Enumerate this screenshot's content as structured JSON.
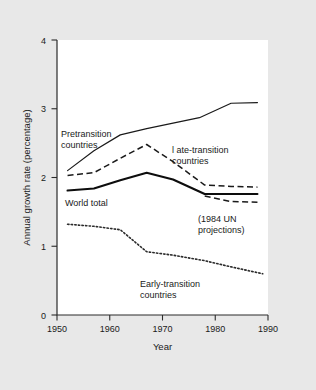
{
  "chart_data": {
    "type": "line",
    "title": "",
    "xlabel": "Year",
    "ylabel": "Annual growth rate (percentage)",
    "xlim": [
      1950,
      1990
    ],
    "ylim": [
      0,
      4
    ],
    "xticks": [
      1950,
      1960,
      1970,
      1980,
      1990
    ],
    "xtick_labels": [
      "1950",
      "1960",
      "1970",
      "1980",
      "1990"
    ],
    "yticks": [
      0,
      1,
      2,
      3,
      4
    ],
    "ytick_labels": [
      "0",
      "1",
      "2",
      "3",
      "4"
    ],
    "grid": false,
    "legend": "annotations-inline",
    "series": [
      {
        "name": "Pretransition countries",
        "style": "solid",
        "x": [
          1952,
          1957,
          1962,
          1967,
          1972,
          1977,
          1983,
          1988
        ],
        "values": [
          2.1,
          2.39,
          2.62,
          2.71,
          2.79,
          2.87,
          3.08,
          3.09
        ]
      },
      {
        "name": "Late-transition countries",
        "style": "dashed",
        "x": [
          1952,
          1957,
          1962,
          1967,
          1972,
          1978,
          1983,
          1988
        ],
        "values": [
          2.03,
          2.07,
          2.28,
          2.48,
          2.23,
          1.89,
          1.87,
          1.86
        ]
      },
      {
        "name": "World total",
        "style": "solid-thick",
        "x": [
          1952,
          1957,
          1962,
          1967,
          1972,
          1978,
          1983,
          1988
        ],
        "values": [
          1.81,
          1.84,
          1.96,
          2.07,
          1.97,
          1.76,
          1.76,
          1.76
        ]
      },
      {
        "name": "(1984 UN projections)",
        "style": "dashed",
        "x": [
          1978,
          1983,
          1988
        ],
        "values": [
          1.73,
          1.65,
          1.64
        ]
      },
      {
        "name": "Early-transition countries",
        "style": "dotted",
        "x": [
          1952,
          1957,
          1962,
          1967,
          1972,
          1978,
          1983,
          1989
        ],
        "values": [
          1.32,
          1.29,
          1.24,
          0.92,
          0.87,
          0.79,
          0.7,
          0.6
        ]
      }
    ],
    "annotations": [
      {
        "text_line1": "Pretransition",
        "text_line2": "countries"
      },
      {
        "text_line1": "l ate-transition",
        "text_line2": "countries"
      },
      {
        "text_line1": "World total",
        "text_line2": ""
      },
      {
        "text_line1": "(1984 UN",
        "text_line2": "projections)"
      },
      {
        "text_line1": "Early-transition",
        "text_line2": "countries"
      }
    ]
  },
  "style": {
    "background": "#e8e8e8",
    "plot_background": "#ffffff",
    "line_color": "#1a1a1a"
  }
}
